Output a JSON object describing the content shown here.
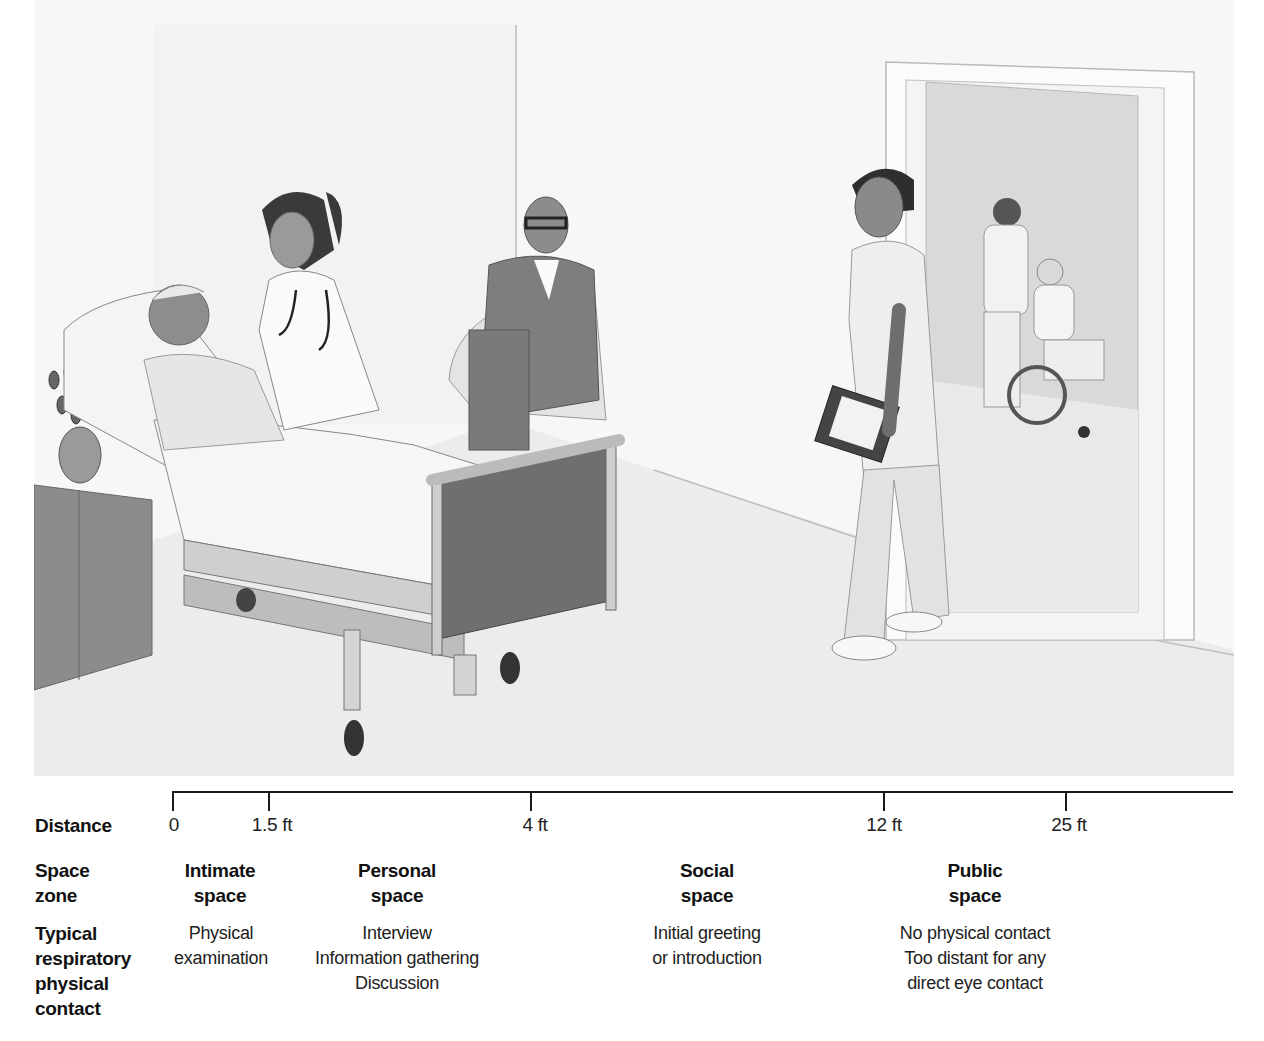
{
  "figure": {
    "scene_elements": [
      {
        "name": "patient-in-bed",
        "zone": "intimate"
      },
      {
        "name": "nurse-with-stethoscope",
        "zone": "intimate"
      },
      {
        "name": "seated-visitor",
        "zone": "personal"
      },
      {
        "name": "clinician-with-clipboard",
        "zone": "social"
      },
      {
        "name": "attendant-pushing-wheelchair",
        "zone": "public"
      }
    ],
    "colors": {
      "background": "#ffffff",
      "wall": "#f3f3f3",
      "floor": "#ebebeb",
      "doorway": "#d6d6d6",
      "line": "#1a1a1a",
      "text": "#111111"
    }
  },
  "scale": {
    "row_label": "Distance",
    "ticks": [
      {
        "label": "0",
        "value_ft": 0
      },
      {
        "label": "1.5 ft",
        "value_ft": 1.5
      },
      {
        "label": "4 ft",
        "value_ft": 4
      },
      {
        "label": "12 ft",
        "value_ft": 12
      },
      {
        "label": "25 ft",
        "value_ft": 25
      }
    ]
  },
  "rows": {
    "space_zone": {
      "line1": "Space",
      "line2": "zone"
    },
    "contact": {
      "line1": "Typical",
      "line2": "respiratory",
      "line3": "physical",
      "line4": "contact"
    }
  },
  "zones": [
    {
      "name_line1": "Intimate",
      "name_line2": "space",
      "desc": [
        "Physical",
        "examination"
      ]
    },
    {
      "name_line1": "Personal",
      "name_line2": "space",
      "desc": [
        "Interview",
        "Information gathering",
        "Discussion"
      ]
    },
    {
      "name_line1": "Social",
      "name_line2": "space",
      "desc": [
        "Initial greeting",
        "or introduction"
      ]
    },
    {
      "name_line1": "Public",
      "name_line2": "space",
      "desc": [
        "No physical contact",
        "Too distant for any",
        "direct eye contact"
      ]
    }
  ]
}
